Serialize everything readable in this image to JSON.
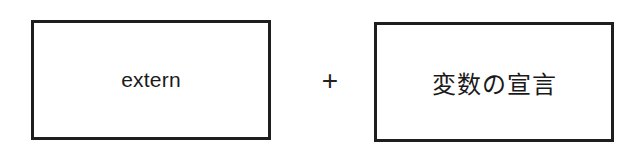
{
  "diagram": {
    "left_box": {
      "label": "extern"
    },
    "operator": "+",
    "right_box": {
      "label": "変数の宣言"
    }
  },
  "colors": {
    "border": "#1e1e1e",
    "text": "#1a1a1a",
    "background": "#ffffff"
  }
}
